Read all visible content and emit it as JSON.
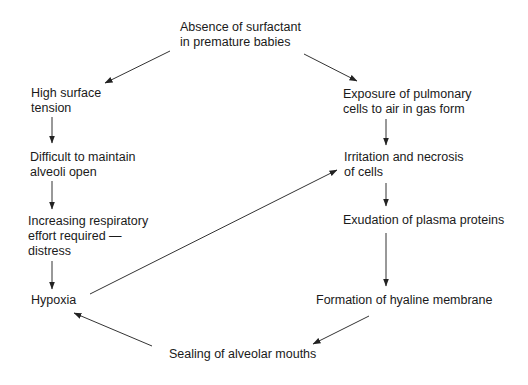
{
  "diagram": {
    "nodes": [
      {
        "id": "absence",
        "lines": [
          "Absence of surfactant",
          "in premature babies"
        ]
      },
      {
        "id": "surface_tension",
        "lines": [
          "High surface",
          "tension"
        ]
      },
      {
        "id": "difficult",
        "lines": [
          "Difficult to maintain",
          "alveoli open"
        ]
      },
      {
        "id": "effort",
        "lines": [
          "Increasing respiratory",
          "effort required —",
          "distress"
        ]
      },
      {
        "id": "hypoxia",
        "lines": [
          "Hypoxia"
        ]
      },
      {
        "id": "exposure",
        "lines": [
          "Exposure of pulmonary",
          "cells to air in gas form"
        ]
      },
      {
        "id": "irritation",
        "lines": [
          "Irritation and necrosis",
          "of cells"
        ]
      },
      {
        "id": "exudation",
        "lines": [
          "Exudation of plasma proteins"
        ]
      },
      {
        "id": "formation",
        "lines": [
          "Formation of hyaline membrane"
        ]
      },
      {
        "id": "sealing",
        "lines": [
          "Sealing of alveolar mouths"
        ]
      }
    ],
    "edges": [
      {
        "from": "absence",
        "to": "surface_tension"
      },
      {
        "from": "absence",
        "to": "exposure"
      },
      {
        "from": "surface_tension",
        "to": "difficult"
      },
      {
        "from": "difficult",
        "to": "effort"
      },
      {
        "from": "effort",
        "to": "hypoxia"
      },
      {
        "from": "hypoxia",
        "to": "irritation"
      },
      {
        "from": "exposure",
        "to": "irritation"
      },
      {
        "from": "irritation",
        "to": "exudation"
      },
      {
        "from": "exudation",
        "to": "formation"
      },
      {
        "from": "formation",
        "to": "sealing"
      },
      {
        "from": "sealing",
        "to": "hypoxia"
      }
    ],
    "colors": {
      "text": "#1a1a1a",
      "line": "#333333",
      "background": "#ffffff"
    }
  }
}
